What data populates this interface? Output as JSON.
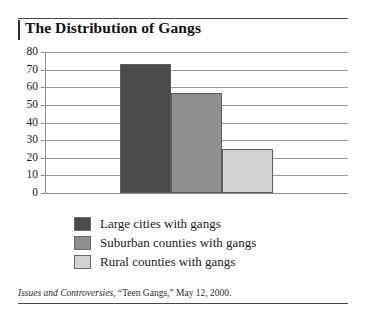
{
  "chart_data": {
    "type": "bar",
    "title": "The Distribution of Gangs",
    "categories": [
      "Large cities with gangs",
      "Suburban counties with gangs",
      "Rural counties with gangs"
    ],
    "values": [
      73,
      57,
      25
    ],
    "xlabel": "",
    "ylabel": "",
    "ylim": [
      0,
      80
    ],
    "ytick_labels": [
      "80",
      "70",
      "60",
      "50",
      "40",
      "30",
      "20",
      "10",
      "0"
    ],
    "ytick_values": [
      80,
      70,
      60,
      50,
      40,
      30,
      20,
      10,
      0
    ],
    "grid": true,
    "legend_position": "below-plot",
    "series": [
      {
        "name": "Large cities with gangs",
        "value": 73,
        "color": "#4b4b4b"
      },
      {
        "name": "Suburban counties with gangs",
        "value": 57,
        "color": "#8f8f8f"
      },
      {
        "name": "Rural counties with gangs",
        "value": 25,
        "color": "#d2d2d2"
      }
    ]
  },
  "legend": {
    "items": [
      {
        "label": "Large cities with gangs",
        "color": "#4b4b4b"
      },
      {
        "label": "Suburban counties with gangs",
        "color": "#8f8f8f"
      },
      {
        "label": "Rural counties with gangs",
        "color": "#d2d2d2"
      }
    ]
  },
  "source": {
    "publication": "Issues and Controversies",
    "rest": ", “Teen Gangs,” May 12, 2000."
  }
}
